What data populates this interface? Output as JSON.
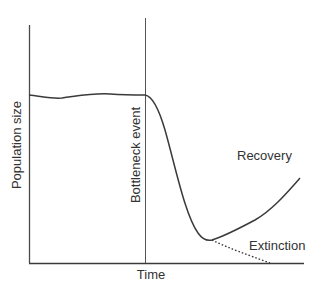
{
  "diagram": {
    "axes": {
      "x_label": "Time",
      "y_label": "Population size"
    },
    "event_label": "Bottleneck event",
    "curves": [
      {
        "name": "recovery",
        "label": "Recovery",
        "style": "solid"
      },
      {
        "name": "extinction",
        "label": "Extinction",
        "style": "dotted"
      }
    ],
    "colors": {
      "line": "#3a3a3a",
      "text": "#333333",
      "background": "#ffffff"
    }
  }
}
